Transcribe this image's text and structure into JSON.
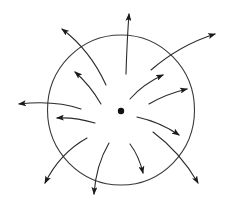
{
  "diagram": {
    "colors": {
      "background": "#ffffff",
      "stroke": "#2a2a2a",
      "boundary": "#3a3a3a",
      "charge": "#111111"
    },
    "boundary_circle": {
      "cx": 121,
      "cy": 110,
      "rx": 73.5,
      "ry": 75
    },
    "center_charge": {
      "cx": 121,
      "cy": 111,
      "r": 3.2
    },
    "arrows": [
      {
        "id": "arrow-top",
        "d": "M126,74 Q127,40 129,14",
        "crosses_boundary": true
      },
      {
        "id": "arrow-upper-right-long",
        "d": "M151,70 Q180,45 215,34",
        "crosses_boundary": true
      },
      {
        "id": "arrow-upper-right-1",
        "d": "M130,99 Q143,84 163,75",
        "crosses_boundary": false
      },
      {
        "id": "arrow-upper-right-2",
        "d": "M149,104 Q166,94 187,89",
        "crosses_boundary": false
      },
      {
        "id": "arrow-lower-right-1",
        "d": "M137,117 Q160,122 179,135",
        "crosses_boundary": false
      },
      {
        "id": "arrow-lower-right-long",
        "d": "M153,132 Q180,152 198,183",
        "crosses_boundary": true
      },
      {
        "id": "arrow-bottom-center",
        "d": "M130,144 Q139,156 143,173",
        "crosses_boundary": false
      },
      {
        "id": "arrow-bottom-long",
        "d": "M109,143 Q96,165 94,194",
        "crosses_boundary": true
      },
      {
        "id": "arrow-lower-left-long",
        "d": "M87,138 Q60,153 45,183",
        "crosses_boundary": true
      },
      {
        "id": "arrow-left-short",
        "d": "M95,123 Q75,117 57,118",
        "crosses_boundary": false
      },
      {
        "id": "arrow-left-long",
        "d": "M81,109 Q55,100 19,104",
        "crosses_boundary": true
      },
      {
        "id": "arrow-upper-left-short",
        "d": "M101,104 Q90,85 75,72",
        "crosses_boundary": false
      },
      {
        "id": "arrow-upper-left-long",
        "d": "M106,85 Q90,50 62,29",
        "crosses_boundary": true
      }
    ]
  }
}
